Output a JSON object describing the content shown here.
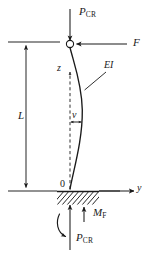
{
  "figure": {
    "type": "engineering-diagram",
    "stroke_color": "#1a1a1a",
    "background_color": "#ffffff"
  },
  "labels": {
    "load_top_symbol": "P",
    "load_top_subscript": "CR",
    "force_horizontal": "F",
    "flexural_rigidity": "EI",
    "axis_vertical": "z",
    "axis_horizontal": "y",
    "deflection": "v",
    "length": "L",
    "origin": "0",
    "moment_fixed_symbol": "M",
    "moment_fixed_subscript": "F",
    "load_bottom_symbol": "P",
    "load_bottom_subscript": "CR"
  },
  "geometry": {
    "column_top_x": 70,
    "column_top_y": 44,
    "column_base_x": 70,
    "column_base_y": 191,
    "length_dim_x": 26,
    "length_dim_top_y": 42,
    "length_dim_bottom_y": 191,
    "max_deflection_px": 12,
    "hatch_left_x": 57,
    "hatch_right_x": 99,
    "hatch_depth_px": 13
  }
}
